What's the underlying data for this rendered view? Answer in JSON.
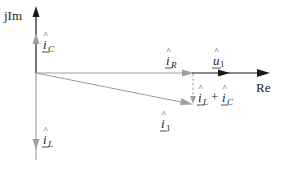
{
  "diagram": {
    "type": "phasor-diagram",
    "axes": {
      "imag_label": "jIm",
      "real_label": "Re"
    },
    "phasors": [
      {
        "name": "i_C",
        "label_main": "i",
        "label_sub": "C",
        "direction": "up",
        "color": "#a0a0a0"
      },
      {
        "name": "i_L",
        "label_main": "i",
        "label_sub": "L",
        "direction": "down",
        "color": "#a0a0a0"
      },
      {
        "name": "i_R",
        "label_main": "i",
        "label_sub": "R",
        "direction": "right",
        "color": "#a0a0a0"
      },
      {
        "name": "u_1",
        "label_main": "u",
        "label_sub": "1",
        "direction": "right",
        "color": "#1a1a1a"
      },
      {
        "name": "i_1",
        "label_main": "i",
        "label_sub": "1",
        "direction": "down-right",
        "color": "#a0a0a0"
      }
    ],
    "sum_label": {
      "a_main": "i",
      "a_sub": "L",
      "plus": "+",
      "b_main": "i",
      "b_sub": "C"
    },
    "colors": {
      "axis": "#1a1a1a",
      "current_phasor": "#a0a0a0",
      "text": "#222222"
    }
  }
}
